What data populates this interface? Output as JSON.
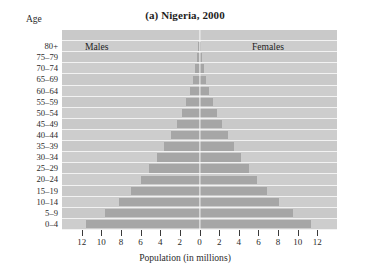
{
  "chart_data": {
    "type": "bar",
    "subtype": "population-pyramid",
    "title": "(a) Nigeria, 2000",
    "xlabel": "Population (in millions)",
    "ylabel": "Age",
    "xlim": [
      -13,
      13
    ],
    "xticks": [
      12,
      10,
      8,
      6,
      4,
      2,
      0,
      2,
      4,
      6,
      8,
      10,
      12
    ],
    "xtick_values": [
      -12,
      -10,
      -8,
      -6,
      -4,
      -2,
      0,
      2,
      4,
      6,
      8,
      10,
      12
    ],
    "grid": false,
    "legend_position": "inside-top",
    "categories": [
      "0–4",
      "5–9",
      "10–14",
      "15–19",
      "20–24",
      "25–29",
      "30–34",
      "35–39",
      "40–44",
      "45–49",
      "50–54",
      "55–59",
      "60–64",
      "65–69",
      "70–74",
      "75–79",
      "80+"
    ],
    "series": [
      {
        "name": "Males",
        "values": [
          11.6,
          9.6,
          8.2,
          7.0,
          6.0,
          5.1,
          4.3,
          3.6,
          2.9,
          2.3,
          1.8,
          1.4,
          1.0,
          0.7,
          0.45,
          0.25,
          0.15
        ]
      },
      {
        "name": "Females",
        "values": [
          11.4,
          9.5,
          8.1,
          6.9,
          5.9,
          5.0,
          4.2,
          3.5,
          2.9,
          2.3,
          1.8,
          1.4,
          1.0,
          0.7,
          0.45,
          0.25,
          0.18
        ]
      }
    ],
    "colors": {
      "bar": "#a6a6a6",
      "plot_background": "#c9c9c9",
      "band_line": "#f2f2f2",
      "center_line": "#f7f7f7"
    }
  },
  "labels": {
    "age_caption": "Age",
    "males": "Males",
    "females": "Females"
  }
}
